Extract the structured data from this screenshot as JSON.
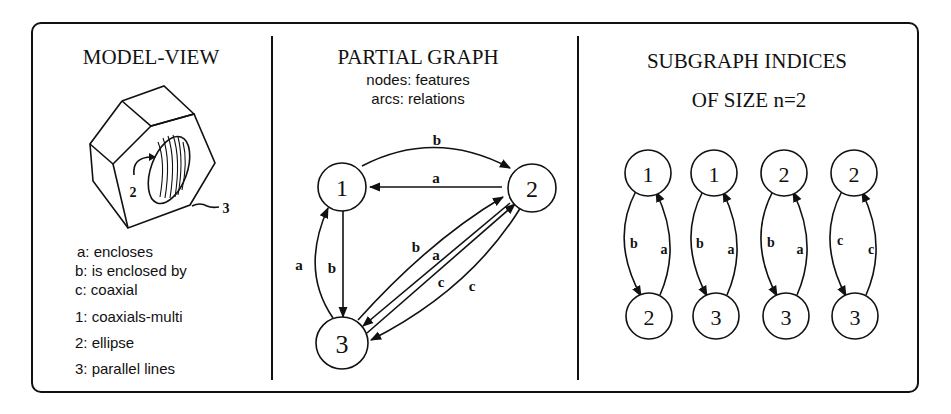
{
  "panels": {
    "model_view": {
      "title": "MODEL-VIEW",
      "callouts": {
        "ellipse_num": "2",
        "parallel_num": "3"
      },
      "relations_legend": [
        "a: encloses",
        "b: is enclosed by",
        "c: coaxial"
      ],
      "features_legend": [
        "1: coaxials-multi",
        "2: ellipse",
        "3: parallel lines"
      ]
    },
    "partial_graph": {
      "title": "PARTIAL GRAPH",
      "subtitle_1": "nodes: features",
      "subtitle_2": "arcs: relations",
      "nodes": [
        {
          "id": "1",
          "label": "1"
        },
        {
          "id": "2",
          "label": "2"
        },
        {
          "id": "3",
          "label": "3"
        }
      ],
      "edges": [
        {
          "from": "1",
          "to": "2",
          "label": "b"
        },
        {
          "from": "2",
          "to": "1",
          "label": "a"
        },
        {
          "from": "3",
          "to": "1",
          "label": "a"
        },
        {
          "from": "1",
          "to": "3",
          "label": "b"
        },
        {
          "from": "3",
          "to": "2",
          "label": "b"
        },
        {
          "from": "2",
          "to": "3",
          "label": "a"
        },
        {
          "from": "3",
          "to": "2",
          "label": "c"
        },
        {
          "from": "2",
          "to": "3",
          "label": "c"
        }
      ]
    },
    "subgraph_indices": {
      "title_1": "SUBGRAPH INDICES",
      "title_2": "OF SIZE n=2",
      "subgraphs": [
        {
          "top": "1",
          "bottom": "2",
          "down_label": "b",
          "up_label": "a"
        },
        {
          "top": "1",
          "bottom": "3",
          "down_label": "b",
          "up_label": "a"
        },
        {
          "top": "2",
          "bottom": "3",
          "down_label": "b",
          "up_label": "a"
        },
        {
          "top": "2",
          "bottom": "3",
          "down_label": "c",
          "up_label": "c"
        }
      ]
    }
  }
}
